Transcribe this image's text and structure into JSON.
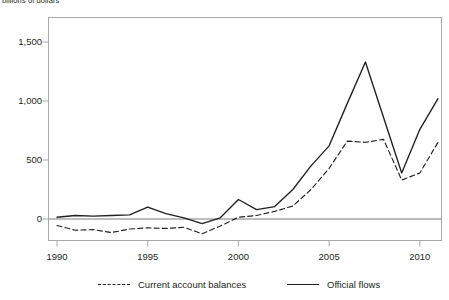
{
  "chart_data": {
    "type": "line",
    "title": "billions of dollars",
    "xlabel": "",
    "ylabel": "",
    "xlim": [
      1990,
      2011
    ],
    "ylim": [
      -200,
      1600
    ],
    "yticks": [
      0,
      500,
      1000,
      1500
    ],
    "ytick_labels": [
      "0",
      "500",
      "1,000",
      "1,500"
    ],
    "xticks": [
      1990,
      1995,
      2000,
      2005,
      2010
    ],
    "xtick_labels": [
      "1990",
      "1995",
      "2000",
      "2005",
      "2010"
    ],
    "grid": false,
    "zero_line": true,
    "legend_position": "bottom",
    "x": [
      1990,
      1991,
      1992,
      1993,
      1994,
      1995,
      1996,
      1997,
      1998,
      1999,
      2000,
      2001,
      2002,
      2003,
      2004,
      2005,
      2006,
      2007,
      2008,
      2009,
      2010,
      2011
    ],
    "series": [
      {
        "name": "Current account balances",
        "style": "dashed",
        "color": "#231f20",
        "values": [
          -55,
          -95,
          -90,
          -115,
          -85,
          -75,
          -80,
          -70,
          -125,
          -60,
          15,
          30,
          65,
          110,
          250,
          430,
          660,
          650,
          675,
          330,
          390,
          650
        ]
      },
      {
        "name": "Official flows",
        "style": "solid",
        "color": "#231f20",
        "values": [
          15,
          30,
          25,
          30,
          35,
          100,
          45,
          10,
          -40,
          10,
          165,
          80,
          105,
          250,
          450,
          620,
          980,
          1330,
          860,
          390,
          760,
          1020
        ]
      }
    ]
  },
  "axis_title": "billions of dollars",
  "legend": {
    "items": [
      {
        "label": "Current account balances",
        "style": "dashed"
      },
      {
        "label": "Official flows",
        "style": "solid"
      }
    ]
  },
  "colors": {
    "line": "#231f20",
    "frame": "#a7a9ac",
    "zero_line": "#6d6e71",
    "text": "#231f20"
  }
}
